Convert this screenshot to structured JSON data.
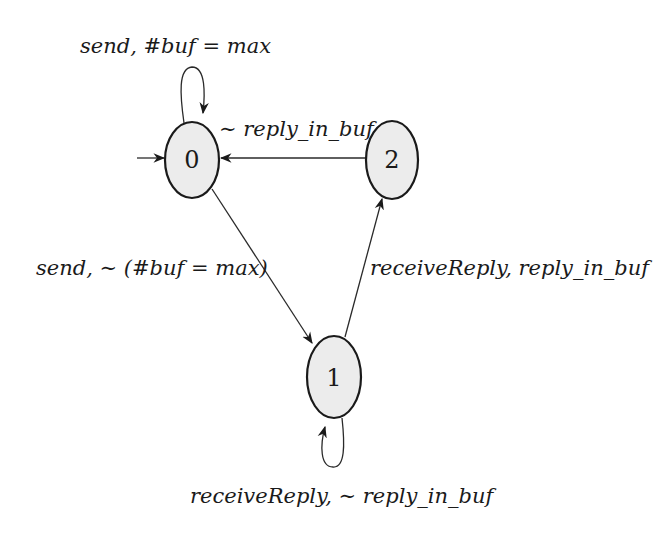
{
  "diagram": {
    "type": "state-machine",
    "initial_state": "0",
    "colors": {
      "node_fill": "#ececec",
      "stroke": "#1a1a1a",
      "background": "#ffffff"
    },
    "nodes": [
      {
        "id": "0",
        "label": "0"
      },
      {
        "id": "1",
        "label": "1"
      },
      {
        "id": "2",
        "label": "2"
      }
    ],
    "edges": [
      {
        "from": "0",
        "to": "0",
        "label": "send, #buf = max"
      },
      {
        "from": "0",
        "to": "1",
        "label": "send, ∼ (#buf = max)"
      },
      {
        "from": "1",
        "to": "2",
        "label": "receiveReply, reply_in_buf"
      },
      {
        "from": "2",
        "to": "0",
        "label": "∼ reply_in_buf"
      },
      {
        "from": "1",
        "to": "1",
        "label": "receiveReply, ∼ reply_in_buf"
      }
    ]
  }
}
